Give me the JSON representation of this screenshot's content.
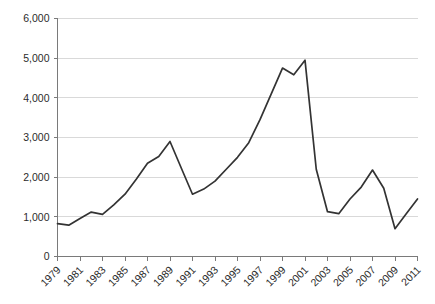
{
  "chart_data": {
    "type": "line",
    "title": "",
    "subtitle": "",
    "xlabel": "",
    "ylabel": "",
    "grid": "horizontal",
    "legend": "none",
    "line_color": "#333333",
    "grid_color": "#d9d9d9",
    "axis_color": "#7a7a7a",
    "xlim": [
      1979,
      2011
    ],
    "ylim": [
      0,
      6000
    ],
    "ytick_labels": [
      "0",
      "1,000",
      "2,000",
      "3,000",
      "4,000",
      "5,000",
      "6,000"
    ],
    "ytick_values": [
      0,
      1000,
      2000,
      3000,
      4000,
      5000,
      6000
    ],
    "xtick_labels": [
      "1979",
      "1981",
      "1983",
      "1985",
      "1987",
      "1989",
      "1991",
      "1993",
      "1995",
      "1997",
      "1999",
      "2001",
      "2003",
      "2005",
      "2007",
      "2009",
      "2011"
    ],
    "xtick_values": [
      1979,
      1981,
      1983,
      1985,
      1987,
      1989,
      1991,
      1993,
      1995,
      1997,
      1999,
      2001,
      2003,
      2005,
      2007,
      2009,
      2011
    ],
    "x": [
      1979,
      1980,
      1981,
      1982,
      1983,
      1984,
      1985,
      1986,
      1987,
      1988,
      1989,
      1990,
      1991,
      1992,
      1993,
      1994,
      1995,
      1996,
      1997,
      1998,
      1999,
      2000,
      2001,
      2002,
      2003,
      2004,
      2005,
      2006,
      2007,
      2008,
      2009,
      2010,
      2011
    ],
    "values": [
      830,
      790,
      960,
      1120,
      1060,
      1300,
      1570,
      1950,
      2350,
      2520,
      2900,
      2230,
      1570,
      1700,
      1900,
      2200,
      2500,
      2870,
      3450,
      4100,
      4750,
      4580,
      4950,
      2200,
      1130,
      1080,
      1450,
      1750,
      2180,
      1720,
      700,
      1080,
      1450
    ]
  }
}
